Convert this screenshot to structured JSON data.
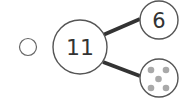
{
  "option": {
    "selected": false
  },
  "number_bond": {
    "whole": "11",
    "part_top": "6",
    "part_bottom_dots": 5
  },
  "colors": {
    "stroke": "#555555",
    "line": "#333333",
    "dot": "#a9a9a9"
  }
}
